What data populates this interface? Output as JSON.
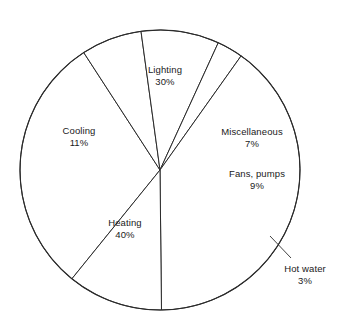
{
  "chart_data": {
    "type": "pie",
    "title": "",
    "subtitle": "",
    "xlabel": "",
    "ylabel": "",
    "legend_position": "none",
    "grid": false,
    "units": "%",
    "total": 100,
    "categories": [
      "Lighting",
      "Miscellaneous",
      "Fans, pumps",
      "Hot water",
      "Heating",
      "Cooling"
    ],
    "values": [
      30,
      7,
      9,
      3,
      40,
      11
    ],
    "slices": [
      {
        "label": "Lighting",
        "value": 30,
        "value_text": "30%",
        "label_x": 165,
        "label_y": 76,
        "callout": false
      },
      {
        "label": "Miscellaneous",
        "value": 7,
        "value_text": "7%",
        "label_x": 252,
        "label_y": 138,
        "callout": false
      },
      {
        "label": "Fans, pumps",
        "value": 9,
        "value_text": "9%",
        "label_x": 257,
        "label_y": 180,
        "callout": false
      },
      {
        "label": "Hot water",
        "value": 3,
        "value_text": "3%",
        "label_x": 305,
        "label_y": 275,
        "callout": true
      },
      {
        "label": "Heating",
        "value": 40,
        "value_text": "40%",
        "label_x": 125,
        "label_y": 229,
        "callout": false
      },
      {
        "label": "Cooling",
        "value": 11,
        "value_text": "11%",
        "label_x": 79,
        "label_y": 137,
        "callout": false
      }
    ],
    "geometry": {
      "center_x": 160,
      "center_y": 170,
      "radius": 140,
      "start_angle_deg": -141
    },
    "colors": {
      "stroke": "#2b2b2b",
      "fill": "#ffffff",
      "text": "#1a1a1a",
      "background": "#ffffff"
    }
  }
}
